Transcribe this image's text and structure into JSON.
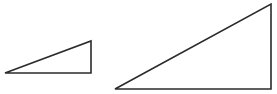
{
  "canvas": {
    "width": 277,
    "height": 94,
    "background": "#ffffff"
  },
  "stroke": {
    "color": "#2b2b2b",
    "width": 1.6
  },
  "shapes": [
    {
      "id": "small-triangle",
      "type": "right-triangle",
      "points": "5,73 91,41 91,73"
    },
    {
      "id": "large-triangle",
      "type": "right-triangle",
      "points": "115,89 271,4 271,89"
    }
  ]
}
